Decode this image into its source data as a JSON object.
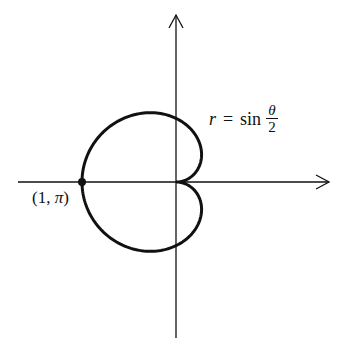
{
  "figure": {
    "width": 342,
    "height": 353,
    "background": "#ffffff",
    "stroke_color": "#111111",
    "origin_px": [
      176,
      182
    ],
    "scale_px": {
      "x": 94,
      "y": 90
    }
  },
  "axes": {
    "x_axis": {
      "from": [
        18,
        182
      ],
      "to": [
        329,
        182
      ],
      "arrow": "right"
    },
    "y_axis": {
      "from": [
        176,
        338
      ],
      "to": [
        176,
        15
      ],
      "arrow": "up"
    }
  },
  "curve": {
    "equation_label": {
      "lhs": "r",
      "equals": "=",
      "func": "sin",
      "numerator": "θ",
      "denominator": "2"
    },
    "type": "polar",
    "theta_range": [
      0,
      6.283185307
    ],
    "samples": 240,
    "stroke_width": 3
  },
  "point": {
    "label": "(1, π)",
    "label_parts": {
      "open": "(1, ",
      "pi": "π",
      "close": ")"
    },
    "polar": [
      1,
      3.14159265
    ],
    "radius_px": 4
  }
}
